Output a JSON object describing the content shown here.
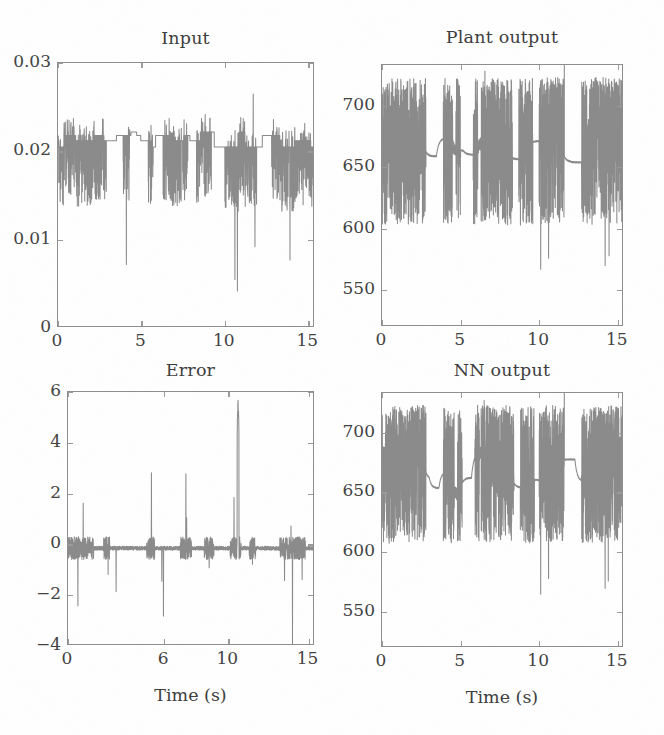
{
  "figure": {
    "width": 664,
    "height": 735,
    "background": "#ffffff",
    "trace_color": "#8a8a8a",
    "axis_color": "#8d8d8d",
    "text_color": "#3f3f3f",
    "layout": "2x2 grid of time-series subplots"
  },
  "chart_data": [
    {
      "id": "input",
      "type": "line",
      "title": "Input",
      "xlabel": "",
      "ylabel": "",
      "xlim": [
        0,
        15.4
      ],
      "ylim": [
        0,
        0.03
      ],
      "xticks": [
        0,
        5,
        10,
        15
      ],
      "xticklabels": [
        "0",
        "5",
        "10",
        "15"
      ],
      "yticks": [
        0,
        0.01,
        0.02,
        0.03
      ],
      "yticklabels": [
        "0",
        "0.01",
        "0.02",
        "0.03"
      ],
      "grid": false,
      "legend": "none",
      "series": [
        {
          "name": "control input u(t)",
          "description": "Piecewise-constant control signal near 0.020-0.022 with dense downward chattering spikes; deepest dips to ~0.004 around t=10.7 and ~0.007 at t=4.1 and t=13.9; upward spikes reach ~0.026.",
          "baseline": 0.0215,
          "plateau_levels": [
            0.0205,
            0.0212,
            0.0218,
            0.0222
          ],
          "spike_down_min": 0.004,
          "spike_up_max": 0.0265,
          "burst_windows": [
            [
              0.0,
              2.9
            ],
            [
              3.9,
              4.3
            ],
            [
              5.4,
              5.7
            ],
            [
              6.3,
              7.8
            ],
            [
              8.3,
              9.2
            ],
            [
              10.0,
              11.9
            ],
            [
              12.8,
              15.3
            ]
          ],
          "notable_points": [
            {
              "t": 4.1,
              "y": 0.0072
            },
            {
              "t": 10.6,
              "y": 0.0055
            },
            {
              "t": 10.75,
              "y": 0.0042
            },
            {
              "t": 11.7,
              "y": 0.0265
            },
            {
              "t": 11.8,
              "y": 0.0092
            },
            {
              "t": 13.9,
              "y": 0.0077
            }
          ]
        }
      ]
    },
    {
      "id": "plant_output",
      "type": "line",
      "title": "Plant output",
      "xlabel": "",
      "ylabel": "",
      "xlim": [
        0,
        15.4
      ],
      "ylim": [
        520,
        733
      ],
      "xticks": [
        0,
        5,
        10,
        15
      ],
      "xticklabels": [
        "0",
        "5",
        "10",
        "15"
      ],
      "yticks": [
        550,
        600,
        650,
        700
      ],
      "yticklabels": [
        "550",
        "600",
        "650",
        "700"
      ],
      "grid": false,
      "legend": "none",
      "series": [
        {
          "name": "plant output y(t)",
          "description": "Heavily oscillating speed/temperature signal centered ~660-680 with rapid excursions between ~600 and ~725; smooth decaying envelopes after each burst settle toward 650-700; deepest dips ~567 near t=10.1 and ~575 near t=10.6 and ~570 near t=14.2.",
          "mean": 668,
          "band": [
            600,
            725
          ],
          "envelope_max": 728,
          "envelope_min": 567,
          "burst_windows": [
            [
              0.0,
              2.8
            ],
            [
              3.9,
              4.5
            ],
            [
              4.7,
              5.0
            ],
            [
              5.8,
              6.1
            ],
            [
              6.3,
              8.3
            ],
            [
              8.7,
              9.6
            ],
            [
              10.0,
              11.6
            ],
            [
              12.7,
              15.3
            ]
          ],
          "smooth_segments": [
            [
              2.8,
              3.9
            ],
            [
              5.0,
              5.8
            ],
            [
              8.3,
              8.7
            ],
            [
              9.6,
              10.0
            ],
            [
              11.6,
              12.7
            ]
          ],
          "notable_points": [
            {
              "t": 6.55,
              "y": 728
            },
            {
              "t": 10.1,
              "y": 567
            },
            {
              "t": 10.6,
              "y": 576
            },
            {
              "t": 11.6,
              "y": 733
            },
            {
              "t": 14.2,
              "y": 570
            },
            {
              "t": 14.45,
              "y": 578
            }
          ]
        }
      ]
    },
    {
      "id": "error",
      "type": "line",
      "title": "Error",
      "xlabel": "Time (s)",
      "ylabel": "",
      "xlim": [
        0,
        15.4
      ],
      "ylim": [
        -4,
        6
      ],
      "xticks": [
        0,
        6,
        10,
        15
      ],
      "xticklabels": [
        "0",
        "6",
        "10",
        "15"
      ],
      "yticks": [
        -4,
        -2,
        0,
        2,
        4,
        6
      ],
      "yticklabels": [
        "-4",
        "-2",
        "0",
        "2",
        "4",
        "6"
      ],
      "grid": false,
      "legend": "none",
      "series": [
        {
          "name": "tracking error e(t)",
          "description": "Near-zero error with sparse impulsive spikes; largest positive spike ~5.8 at t=10.6, others ~2.8 at t=5.2 and t=7.4, ~2.4 at t=11.5, ~1.6 at t=0.95; negative spikes to -2.4 at t=0.6, -2.8 at t=5.9, -3.9 at t=14.0.",
          "baseline": -0.15,
          "noise_amplitude": 0.28,
          "positive_spikes": [
            {
              "t": 0.95,
              "y": 1.62
            },
            {
              "t": 5.2,
              "y": 2.82
            },
            {
              "t": 7.35,
              "y": 2.78
            },
            {
              "t": 7.4,
              "y": 1.05
            },
            {
              "t": 10.35,
              "y": 1.85
            },
            {
              "t": 10.6,
              "y": 5.82
            },
            {
              "t": 11.5,
              "y": 2.38
            },
            {
              "t": 13.9,
              "y": 0.72
            }
          ],
          "negative_spikes": [
            {
              "t": 0.62,
              "y": -2.42
            },
            {
              "t": 2.5,
              "y": -1.18
            },
            {
              "t": 3.0,
              "y": -1.85
            },
            {
              "t": 5.85,
              "y": -1.45
            },
            {
              "t": 5.95,
              "y": -2.82
            },
            {
              "t": 8.8,
              "y": -0.92
            },
            {
              "t": 10.6,
              "y": -1.05
            },
            {
              "t": 11.5,
              "y": -0.78
            },
            {
              "t": 13.5,
              "y": -1.42
            },
            {
              "t": 14.0,
              "y": -3.92
            },
            {
              "t": 14.6,
              "y": -1.38
            }
          ]
        }
      ]
    },
    {
      "id": "nn_output",
      "type": "line",
      "title": "NN output",
      "xlabel": "Time (s)",
      "ylabel": "",
      "xlim": [
        0,
        15.4
      ],
      "ylim": [
        520,
        733
      ],
      "xticks": [
        0,
        5,
        10,
        15
      ],
      "xticklabels": [
        "0",
        "5",
        "10",
        "15"
      ],
      "yticks": [
        550,
        600,
        650,
        700
      ],
      "yticklabels": [
        "550",
        "600",
        "650",
        "700"
      ],
      "grid": false,
      "legend": "none",
      "series": [
        {
          "name": "neural network output",
          "description": "Nearly identical to plant output: dense oscillation centered ~665 spanning ~605-725 with smooth settling segments; deepest dips ~565 near t=10.1, ~578 near t=10.6, ~570 near t=14.2.",
          "mean": 666,
          "band": [
            605,
            725
          ],
          "envelope_max": 727,
          "envelope_min": 565,
          "burst_windows": [
            [
              0.0,
              2.8
            ],
            [
              3.9,
              4.6
            ],
            [
              4.8,
              5.1
            ],
            [
              5.9,
              6.2
            ],
            [
              6.3,
              8.4
            ],
            [
              8.8,
              9.7
            ],
            [
              10.0,
              11.6
            ],
            [
              12.7,
              15.3
            ]
          ],
          "smooth_segments": [
            [
              2.8,
              3.9
            ],
            [
              5.1,
              5.9
            ],
            [
              8.4,
              8.8
            ],
            [
              9.7,
              10.0
            ],
            [
              11.6,
              12.7
            ]
          ],
          "notable_points": [
            {
              "t": 6.5,
              "y": 727
            },
            {
              "t": 9.45,
              "y": 716
            },
            {
              "t": 10.1,
              "y": 565
            },
            {
              "t": 10.6,
              "y": 578
            },
            {
              "t": 11.6,
              "y": 733
            },
            {
              "t": 14.2,
              "y": 570
            },
            {
              "t": 14.4,
              "y": 576
            }
          ]
        }
      ]
    }
  ],
  "panels": [
    {
      "key": "input",
      "frame": {
        "left": 57,
        "top": 62,
        "width": 257,
        "height": 265
      },
      "title_pos": {
        "left": 57,
        "top": 28,
        "width": 257
      },
      "ytick_right": 51,
      "xtick_top": 332
    },
    {
      "key": "plant_output",
      "frame": {
        "left": 381,
        "top": 64,
        "width": 242,
        "height": 262
      },
      "title_pos": {
        "left": 381,
        "top": 27,
        "width": 242
      },
      "ytick_right": 375,
      "xtick_top": 331
    },
    {
      "key": "error",
      "frame": {
        "left": 67,
        "top": 391,
        "width": 247,
        "height": 254
      },
      "title_pos": {
        "left": 67,
        "top": 360,
        "width": 247
      },
      "ytick_right": 61,
      "xtick_top": 650,
      "xlabel_pos": {
        "left": 67,
        "top": 685,
        "width": 247
      }
    },
    {
      "key": "nn_output",
      "frame": {
        "left": 381,
        "top": 392,
        "width": 242,
        "height": 255
      },
      "title_pos": {
        "left": 381,
        "top": 360,
        "width": 242
      },
      "ytick_right": 375,
      "xtick_top": 652,
      "xlabel_pos": {
        "left": 381,
        "top": 687,
        "width": 242
      }
    }
  ]
}
